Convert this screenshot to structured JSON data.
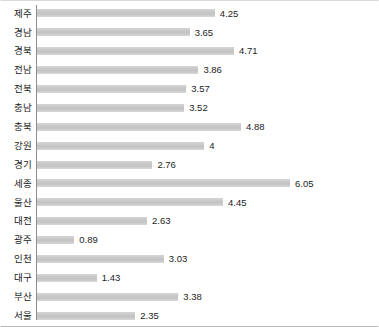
{
  "chart_data": {
    "type": "bar",
    "orientation": "horizontal",
    "title": "",
    "subtitle": "",
    "xlabel": "",
    "ylabel": "",
    "grid": false,
    "legend": null,
    "legend_position": "none",
    "xlim": [
      0,
      6.05
    ],
    "bar_color": "#c8c8c8",
    "axis_color": "#8e8e8e",
    "label_color": "#1b1b1b",
    "value_label_format": "trim-trailing-zeros",
    "categories": [
      "제주",
      "경남",
      "경북",
      "전남",
      "전북",
      "충남",
      "충북",
      "강원",
      "경기",
      "세종",
      "울산",
      "대전",
      "광주",
      "인천",
      "대구",
      "부산",
      "서울"
    ],
    "values": [
      4.25,
      3.65,
      4.71,
      3.86,
      3.57,
      3.52,
      4.88,
      4,
      2.76,
      6.05,
      4.45,
      2.63,
      0.89,
      3.03,
      1.43,
      3.38,
      2.35
    ],
    "value_labels": [
      "4.25",
      "3.65",
      "4.71",
      "3.86",
      "3.57",
      "3.52",
      "4.88",
      "4",
      "2.76",
      "6.05",
      "4.45",
      "2.63",
      "0.89",
      "3.03",
      "1.43",
      "3.38",
      "2.35"
    ],
    "rows": [
      {
        "category": "제주",
        "value": 4.25,
        "label": "4.25"
      },
      {
        "category": "경남",
        "value": 3.65,
        "label": "3.65"
      },
      {
        "category": "경북",
        "value": 4.71,
        "label": "4.71"
      },
      {
        "category": "전남",
        "value": 3.86,
        "label": "3.86"
      },
      {
        "category": "전북",
        "value": 3.57,
        "label": "3.57"
      },
      {
        "category": "충남",
        "value": 3.52,
        "label": "3.52"
      },
      {
        "category": "충북",
        "value": 4.88,
        "label": "4.88"
      },
      {
        "category": "강원",
        "value": 4,
        "label": "4"
      },
      {
        "category": "경기",
        "value": 2.76,
        "label": "2.76"
      },
      {
        "category": "세종",
        "value": 6.05,
        "label": "6.05"
      },
      {
        "category": "울산",
        "value": 4.45,
        "label": "4.45"
      },
      {
        "category": "대전",
        "value": 2.63,
        "label": "2.63"
      },
      {
        "category": "광주",
        "value": 0.89,
        "label": "0.89"
      },
      {
        "category": "인천",
        "value": 3.03,
        "label": "3.03"
      },
      {
        "category": "대구",
        "value": 1.43,
        "label": "1.43"
      },
      {
        "category": "부산",
        "value": 3.38,
        "label": "3.38"
      },
      {
        "category": "서울",
        "value": 2.35,
        "label": "2.35"
      }
    ]
  }
}
